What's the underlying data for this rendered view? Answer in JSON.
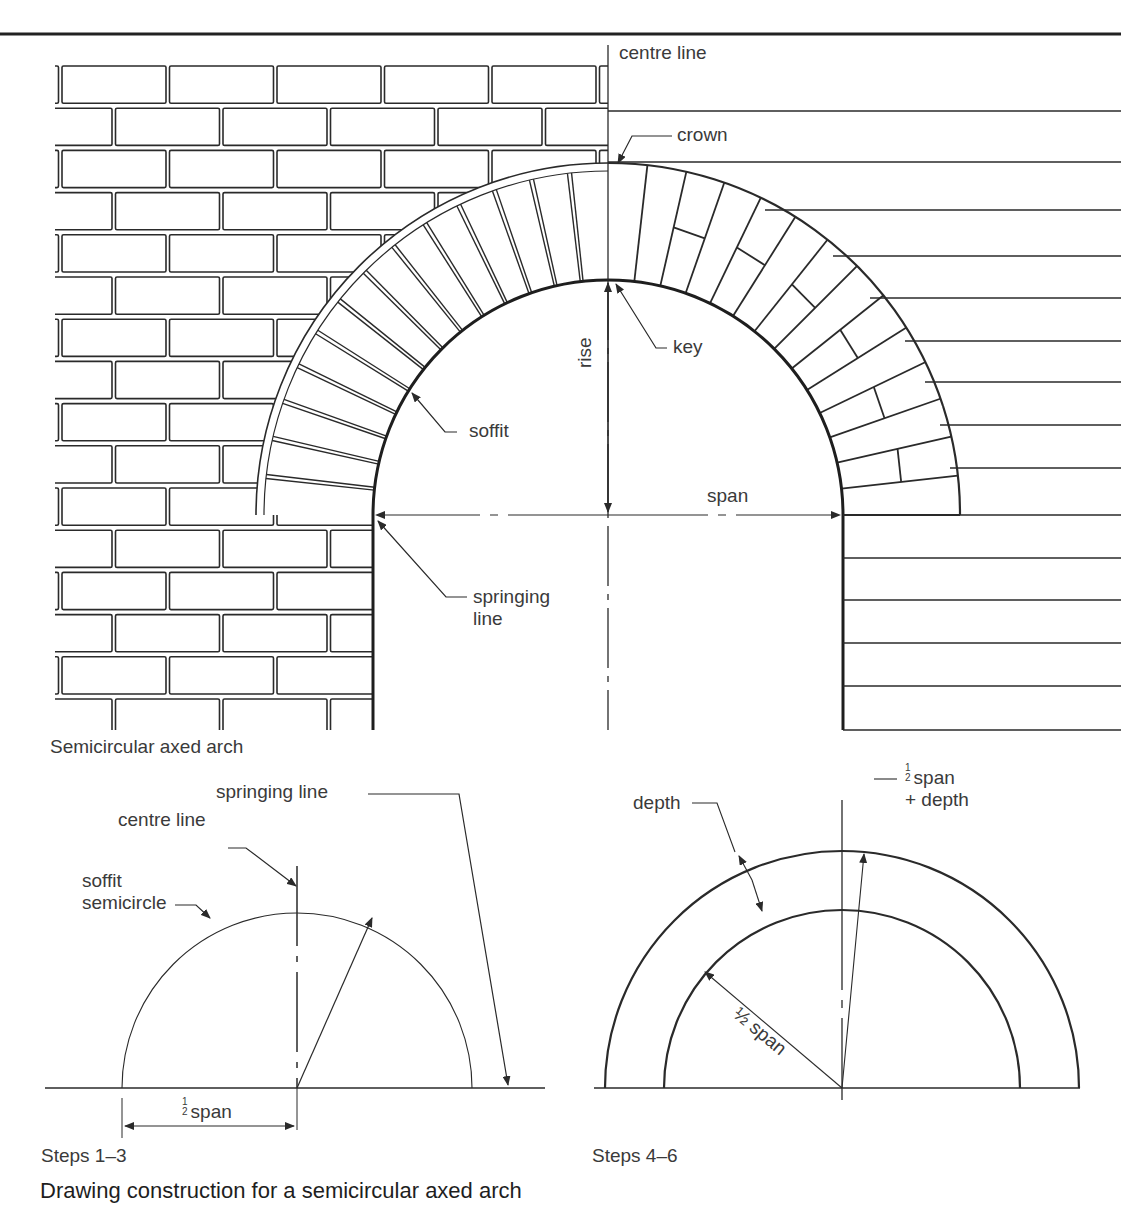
{
  "figure": {
    "main_caption": "Semicircular axed arch",
    "steps_a_caption": "Steps 1–3",
    "steps_b_caption": "Steps 4–6",
    "title": "Drawing construction for a semicircular axed arch"
  },
  "main_labels": {
    "centre_line": "centre line",
    "crown": "crown",
    "key": "key",
    "rise": "rise",
    "soffit": "soffit",
    "span": "span",
    "springing_line_1": "springing",
    "springing_line_2": "line"
  },
  "steps_a_labels": {
    "springing_line": "springing line",
    "centre_line": "centre line",
    "soffit_1": "soffit",
    "soffit_2": "semicircle",
    "half_num": "1",
    "half_den": "2",
    "half_span": "span"
  },
  "steps_b_labels": {
    "depth": "depth",
    "half_num": "1",
    "half_den": "2",
    "half_span_plus": "span",
    "plus_depth": "+ depth",
    "half_span_radius": "½ span"
  },
  "colors": {
    "ink": "#2a2a2a",
    "paper": "#ffffff"
  }
}
